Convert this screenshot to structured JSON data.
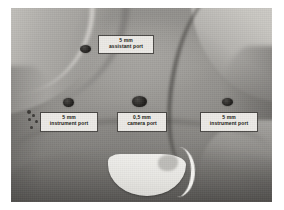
{
  "figure": {
    "caption_alt": "Clinical photograph of an infant abdomen marked with laparoscopic port sites",
    "photo_background_color": "#8e8e8e",
    "plate_border_color": "#ffffff"
  },
  "annotations": {
    "label_box_fill": "#eceae6",
    "label_box_border": "#4a4845",
    "label_text_color": "#16150f",
    "port_dot_color": "#211f1d",
    "ports": [
      {
        "id": "assistant-port",
        "size_line": "5 mm",
        "name_line": "assistant port",
        "dot": {
          "left": 69,
          "top": 37,
          "width": 11,
          "height": 8
        },
        "label": {
          "left": 87,
          "top": 27,
          "width": 56,
          "height": 19
        }
      },
      {
        "id": "left-instrument-port",
        "size_line": "5 mm",
        "name_line": "instrument port",
        "dot": {
          "left": 52,
          "top": 90,
          "width": 11,
          "height": 9
        },
        "label": {
          "left": 29,
          "top": 104,
          "width": 58,
          "height": 20
        }
      },
      {
        "id": "camera-port",
        "size_line": "0,5 mm",
        "name_line": "camera port",
        "dot": {
          "left": 121,
          "top": 88,
          "width": 15,
          "height": 11
        },
        "label": {
          "left": 106,
          "top": 104,
          "width": 50,
          "height": 20
        }
      },
      {
        "id": "right-instrument-port",
        "size_line": "5 mm",
        "name_line": "instrument port",
        "dot": {
          "left": 211,
          "top": 90,
          "width": 11,
          "height": 8
        },
        "label": {
          "left": 189,
          "top": 104,
          "width": 58,
          "height": 20
        }
      }
    ],
    "skin_marks": [
      {
        "left": 16,
        "top": 102,
        "size": 4
      },
      {
        "left": 21,
        "top": 106,
        "size": 3
      },
      {
        "left": 17,
        "top": 110,
        "size": 3
      },
      {
        "left": 24,
        "top": 112,
        "size": 3
      },
      {
        "left": 19,
        "top": 118,
        "size": 3
      }
    ]
  }
}
